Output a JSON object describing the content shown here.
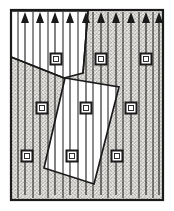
{
  "figure": {
    "title": "Flow field with arrows, node squares and unhatched polygon regions",
    "width": 174,
    "height": 211,
    "background_color": "#ffffff",
    "stroke_color": "#1a1a1a",
    "hatch_fill_color": "#e8e6e2",
    "hatch_dot_color": "#4a4a4a",
    "clear_region_color": "#ffffff"
  },
  "domain_border": {
    "label": "domain-boundary",
    "x": 11,
    "y": 10,
    "width": 152,
    "height": 190,
    "stroke_width": 2.2
  },
  "hatching": {
    "label": "stipple-hatch",
    "pattern": "stipple-dots",
    "dot_spacing": 3,
    "dot_radius": 0.55
  },
  "arrows": {
    "label": "flow-arrows",
    "count": 10,
    "head_width": 8,
    "head_height": 11,
    "shaft_width": 1.1,
    "tip_y": 12,
    "items": [
      {
        "x": 25,
        "tail_y": 195
      },
      {
        "x": 40,
        "tail_y": 195
      },
      {
        "x": 55,
        "tail_y": 195
      },
      {
        "x": 70,
        "tail_y": 195
      },
      {
        "x": 86,
        "tail_y": 195
      },
      {
        "x": 101,
        "tail_y": 195
      },
      {
        "x": 116,
        "tail_y": 195
      },
      {
        "x": 131,
        "tail_y": 195
      },
      {
        "x": 146,
        "tail_y": 195
      },
      {
        "x": 159,
        "tail_y": 195
      }
    ]
  },
  "column_lines": {
    "label": "vertical-partition-lines",
    "stroke_width": 1.0,
    "x_positions": [
      18,
      33,
      48,
      63,
      78,
      93,
      108,
      123,
      139,
      153
    ],
    "y_top": 12,
    "y_bottom": 198
  },
  "nodes": {
    "label": "square-nodes",
    "outer_size": 11,
    "inner_size": 5,
    "stroke_width": 2.0,
    "items": [
      {
        "row": 1,
        "col": 1,
        "x": 56,
        "y": 59
      },
      {
        "row": 1,
        "col": 2,
        "x": 101,
        "y": 59
      },
      {
        "row": 1,
        "col": 3,
        "x": 146,
        "y": 59
      },
      {
        "row": 2,
        "col": 1,
        "x": 42,
        "y": 108
      },
      {
        "row": 2,
        "col": 2,
        "x": 86,
        "y": 108
      },
      {
        "row": 2,
        "col": 3,
        "x": 131,
        "y": 108
      },
      {
        "row": 3,
        "col": 1,
        "x": 27,
        "y": 156
      },
      {
        "row": 3,
        "col": 2,
        "x": 72,
        "y": 156
      },
      {
        "row": 3,
        "col": 3,
        "x": 117,
        "y": 156
      }
    ]
  },
  "clear_regions": [
    {
      "label": "top-left-wedge",
      "name": "clear-region-top-left",
      "points": "11,11 13,11 88,11 83,73 64,78 11,57",
      "stroke_width": 1.6
    },
    {
      "label": "central-rotated-rectangle",
      "name": "clear-region-center",
      "points": "65,78 119,87 94,184 44,168",
      "stroke_width": 1.7
    }
  ],
  "interior_edges": [
    {
      "label": "wedge-lower-edge",
      "name": "wedge-edge-lower",
      "x1": 11,
      "y1": 57,
      "x2": 64,
      "y2": 78
    },
    {
      "label": "wedge-right-edge",
      "name": "wedge-edge-right",
      "x1": 88,
      "y1": 11,
      "x2": 83,
      "y2": 73
    }
  ]
}
